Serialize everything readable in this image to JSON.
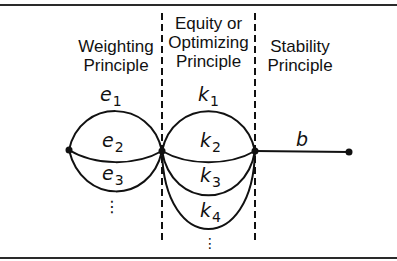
{
  "figure": {
    "columns": [
      {
        "id": "weighting",
        "lines": [
          "Weighting",
          "Principle"
        ]
      },
      {
        "id": "equity",
        "lines": [
          "Equity or",
          "Optimizing",
          "Principle"
        ]
      },
      {
        "id": "stability",
        "lines": [
          "Stability",
          "Principle"
        ]
      }
    ],
    "edges_left": [
      {
        "var": "e",
        "sub": "1"
      },
      {
        "var": "e",
        "sub": "2"
      },
      {
        "var": "e",
        "sub": "3"
      }
    ],
    "edges_middle": [
      {
        "var": "k",
        "sub": "1"
      },
      {
        "var": "k",
        "sub": "2"
      },
      {
        "var": "k",
        "sub": "3"
      },
      {
        "var": "k",
        "sub": "4"
      }
    ],
    "edge_right": {
      "var": "b"
    },
    "ellipsis": "⋮",
    "colors": {
      "ink": "#111111",
      "background": "#ffffff"
    }
  }
}
